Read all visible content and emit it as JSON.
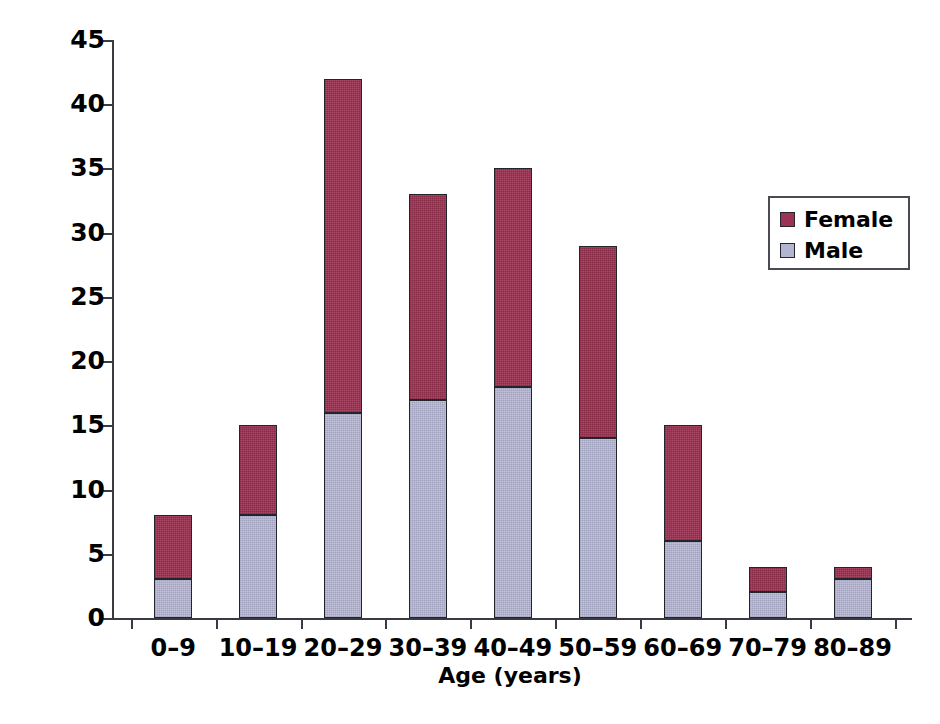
{
  "chart_data": {
    "type": "bar",
    "subtype": "stacked-vertical",
    "title": "",
    "xlabel": "Age (years)",
    "ylabel": "Number of patients",
    "categories": [
      "0–9",
      "10–19",
      "20–29",
      "30–39",
      "40–49",
      "50–59",
      "60–69",
      "70–79",
      "80–89"
    ],
    "series": [
      {
        "name": "Male",
        "color": "#b3b4d2",
        "values": [
          3,
          8,
          16,
          17,
          18,
          14,
          6,
          2,
          3
        ]
      },
      {
        "name": "Female",
        "color": "#9d3354",
        "values": [
          5,
          7,
          26,
          16,
          17,
          15,
          9,
          2,
          1
        ]
      }
    ],
    "totals": [
      8,
      15,
      42,
      33,
      35,
      29,
      15,
      4,
      4
    ],
    "stack_order": [
      "Male",
      "Female"
    ],
    "ylim": [
      0,
      45
    ],
    "yticks": [
      0,
      5,
      10,
      15,
      20,
      25,
      30,
      35,
      40,
      45
    ],
    "ytick_labels": [
      "0",
      "5",
      "10",
      "15",
      "20",
      "25",
      "30",
      "35",
      "40",
      "45"
    ],
    "grid": false,
    "legend_position": "upper right",
    "legend_entries": [
      "Female",
      "Male"
    ],
    "axis_color": "#3a3a42",
    "background": "#ffffff"
  },
  "legend": {
    "items": [
      {
        "label": "Female",
        "color": "#9d3354"
      },
      {
        "label": "Male",
        "color": "#b3b4d2"
      }
    ]
  },
  "axes": {
    "y_title": "Number of patients",
    "x_title": "Age (years)"
  }
}
